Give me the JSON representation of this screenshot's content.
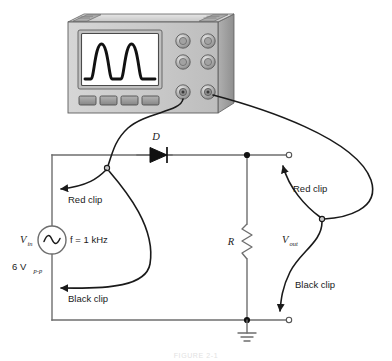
{
  "figure": {
    "caption": "FIGURE 2-1"
  },
  "instrument": {
    "name": "oscilloscope",
    "screen_waveform": "rectified-sine-two-humps",
    "knob_count": 6,
    "button_count": 4,
    "connector_left": "channel-1-connector",
    "connector_right": "channel-2-connector"
  },
  "circuit": {
    "source": {
      "symbol": "~",
      "label": "V",
      "label_sub": "in",
      "frequency": "f = 1 kHz",
      "amplitude": "6 V",
      "amplitude_sub": "p-p"
    },
    "diode": {
      "label": "D"
    },
    "resistor": {
      "label": "R"
    },
    "output": {
      "label": "V",
      "label_sub": "out"
    },
    "ground": "earth-ground"
  },
  "probes": [
    {
      "id": "ch1-red",
      "label": "Red clip"
    },
    {
      "id": "ch1-black",
      "label": "Black clip"
    },
    {
      "id": "ch2-red",
      "label": "Red clip"
    },
    {
      "id": "ch2-black",
      "label": "Black clip"
    }
  ],
  "colors": {
    "wire": "#6e6e6e",
    "cable": "#1a1a1a",
    "ink": "#1a1a1a",
    "body_light": "#d9d9d9",
    "body_mid": "#b9b9b9",
    "body_dark": "#9a9a9a",
    "screen": "#ffffff",
    "background": "#ffffff"
  }
}
